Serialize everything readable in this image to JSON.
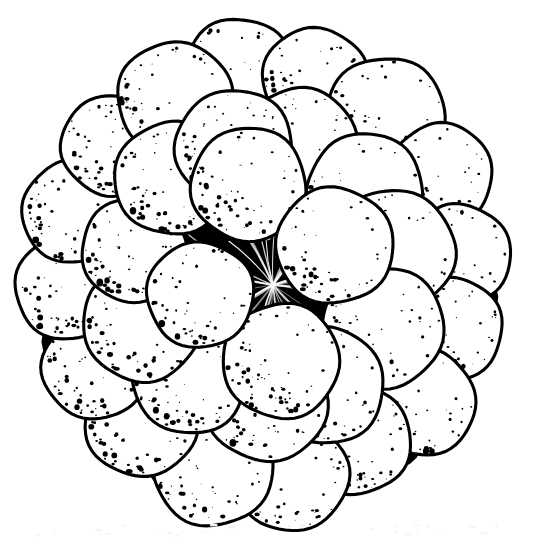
{
  "document": {
    "kind": "botanical-line-illustration",
    "title": "Aggregate fruit viewed from above",
    "caption": "",
    "subject": "aggregate fruit (blackberry / raspberry type) showing drupelets radiating from a dark central receptacle",
    "technique": "pen-and-ink stipple engraving",
    "orientation": "top-down / apical view",
    "has_visible_text": false,
    "visible_text": ""
  },
  "canvas": {
    "width": 535,
    "height": 540,
    "background_color": "#ffffff",
    "ink_color": "#000000"
  },
  "figure": {
    "center_x": 265,
    "center_y": 272,
    "bounds": {
      "left": 18,
      "top": 22,
      "right": 512,
      "bottom": 522
    },
    "outer_radius_x": 247,
    "outer_radius_y": 250
  },
  "receptacle": {
    "name": "central-receptacle",
    "center_x": 265,
    "center_y": 290,
    "radius": 132,
    "fill_color": "#000000",
    "ray_count": 34,
    "ray_color": "#ffffff",
    "description": "solid black hub with fine white radiating striations converging at the core"
  },
  "drupelets": {
    "total_count": 31,
    "fill_color": "#ffffff",
    "outline_color": "#000000",
    "stipple_color": "#000000",
    "stipple_position": "lower-left crescent of each sphere",
    "rings": [
      {
        "name": "outer-ring",
        "count": 16,
        "orbit_radius_x": 196,
        "orbit_radius_y": 198,
        "sphere_radius": 56,
        "start_angle_deg": -96
      },
      {
        "name": "inner-ring",
        "count": 11,
        "orbit_radius_x": 128,
        "orbit_radius_y": 132,
        "sphere_radius": 58,
        "start_angle_deg": -72
      },
      {
        "name": "crown-cluster",
        "count": 4,
        "orbit_radius_x": 72,
        "orbit_radius_y": 86,
        "sphere_radius": 55,
        "start_angle_deg": -104
      }
    ]
  },
  "shading": {
    "stipple_dot_count_per_sphere": 150,
    "stipple_dot_min_radius": 0.5,
    "stipple_dot_max_radius": 2.4,
    "shadow_wedge_color": "#000000",
    "description": "dense black stipple grading to clear white highlight on the upper-right of every drupelet; solid black wedges fill the interstices between spheres"
  },
  "scan_artifacts": {
    "present": true,
    "region": "bottom margin",
    "speck_count": 26,
    "speck_color": "#f4f4f4",
    "description": "faint pale gray specks along the lower margin from the original scan"
  }
}
